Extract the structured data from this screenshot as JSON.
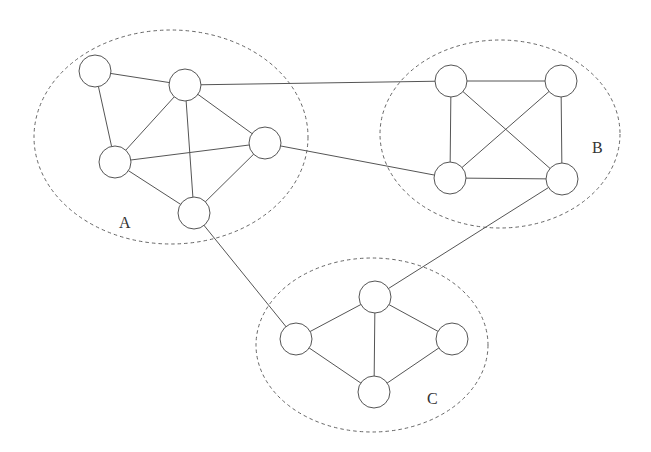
{
  "diagram": {
    "type": "network-clusters",
    "node_radius": 16,
    "clusters": [
      {
        "id": "A",
        "label": "A",
        "cx": 171,
        "cy": 137,
        "rx": 137,
        "ry": 107,
        "label_x": 119,
        "label_y": 228
      },
      {
        "id": "B",
        "label": "B",
        "cx": 500,
        "cy": 134,
        "rx": 120,
        "ry": 94,
        "label_x": 592,
        "label_y": 153
      },
      {
        "id": "C",
        "label": "C",
        "cx": 372,
        "cy": 345,
        "rx": 116,
        "ry": 87,
        "label_x": 427,
        "label_y": 404
      }
    ],
    "nodes": [
      {
        "id": "A1",
        "cluster": "A",
        "x": 95,
        "y": 71
      },
      {
        "id": "A2",
        "cluster": "A",
        "x": 185,
        "y": 85
      },
      {
        "id": "A3",
        "cluster": "A",
        "x": 115,
        "y": 162
      },
      {
        "id": "A4",
        "cluster": "A",
        "x": 265,
        "y": 143
      },
      {
        "id": "A5",
        "cluster": "A",
        "x": 194,
        "y": 213
      },
      {
        "id": "B1",
        "cluster": "B",
        "x": 451,
        "y": 81
      },
      {
        "id": "B2",
        "cluster": "B",
        "x": 561,
        "y": 81
      },
      {
        "id": "B3",
        "cluster": "B",
        "x": 450,
        "y": 178
      },
      {
        "id": "B4",
        "cluster": "B",
        "x": 562,
        "y": 179
      },
      {
        "id": "C1",
        "cluster": "C",
        "x": 375,
        "y": 297
      },
      {
        "id": "C2",
        "cluster": "C",
        "x": 296,
        "y": 339
      },
      {
        "id": "C3",
        "cluster": "C",
        "x": 452,
        "y": 339
      },
      {
        "id": "C4",
        "cluster": "C",
        "x": 374,
        "y": 392
      }
    ],
    "edges": [
      [
        "A1",
        "A2"
      ],
      [
        "A1",
        "A3"
      ],
      [
        "A2",
        "A3"
      ],
      [
        "A2",
        "A4"
      ],
      [
        "A2",
        "A5"
      ],
      [
        "A3",
        "A4"
      ],
      [
        "A3",
        "A5"
      ],
      [
        "A4",
        "A5"
      ],
      [
        "A2",
        "B1"
      ],
      [
        "A4",
        "B3"
      ],
      [
        "A5",
        "C2"
      ],
      [
        "B1",
        "B2"
      ],
      [
        "B1",
        "B3"
      ],
      [
        "B1",
        "B4"
      ],
      [
        "B2",
        "B3"
      ],
      [
        "B2",
        "B4"
      ],
      [
        "B3",
        "B4"
      ],
      [
        "B4",
        "C1"
      ],
      [
        "C1",
        "C2"
      ],
      [
        "C1",
        "C3"
      ],
      [
        "C1",
        "C4"
      ],
      [
        "C2",
        "C4"
      ],
      [
        "C3",
        "C4"
      ]
    ]
  }
}
